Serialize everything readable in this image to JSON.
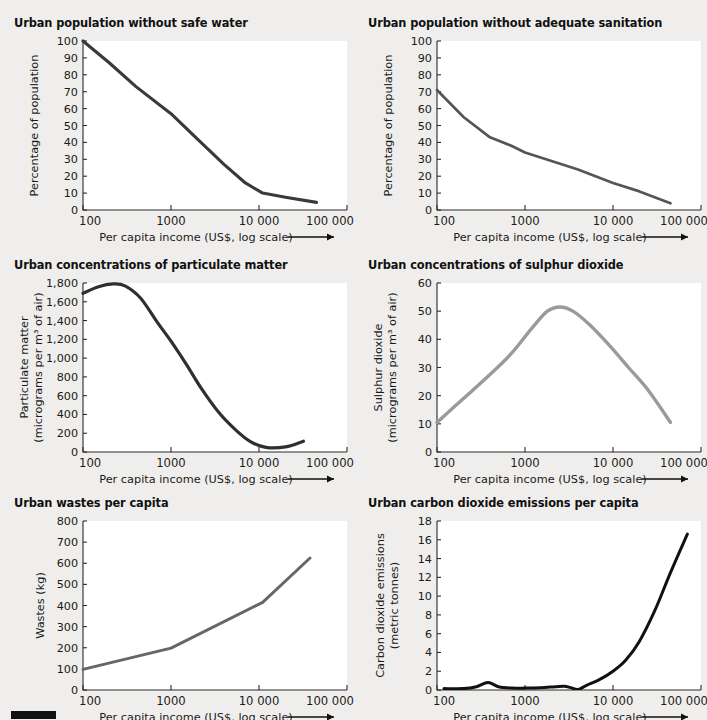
{
  "figure": {
    "background_color": "#efeeec",
    "plot_background_color": "#ffffff",
    "corner_marker": "black-bar"
  },
  "common": {
    "xlabel": "Per capita income (US$, log scale)",
    "xticks": [
      "100",
      "1000",
      "10 000",
      "100 000"
    ],
    "xlim": [
      100,
      100000
    ],
    "xscale": "log"
  },
  "chart_data": [
    {
      "id": "safe-water",
      "type": "line",
      "title": "Urban population without safe water",
      "xlabel": "Per capita income (US$, log scale)",
      "ylabel": "Percentage of population",
      "xscale": "log",
      "xlim": [
        100,
        100000
      ],
      "ylim": [
        0,
        100
      ],
      "xticks": [
        "100",
        "1000",
        "10 000",
        "100 000"
      ],
      "yticks": [
        "0",
        "10",
        "20",
        "30",
        "40",
        "50",
        "60",
        "70",
        "80",
        "90",
        "100"
      ],
      "grid": false,
      "legend": "none",
      "line_color": "#3a3a3a",
      "x": [
        100,
        200,
        400,
        1000,
        2000,
        4000,
        7000,
        11000,
        20000,
        45000
      ],
      "y": [
        100,
        87,
        73,
        57,
        42,
        27,
        16,
        10,
        7.5,
        4.5
      ]
    },
    {
      "id": "sanitation",
      "type": "line",
      "title": "Urban population without adequate sanitation",
      "xlabel": "Per capita income (US$, log scale)",
      "ylabel": "Percentage of population",
      "xscale": "log",
      "xlim": [
        100,
        100000
      ],
      "ylim": [
        0,
        100
      ],
      "xticks": [
        "100",
        "1000",
        "10 000",
        "100 000"
      ],
      "yticks": [
        "0",
        "10",
        "20",
        "30",
        "40",
        "50",
        "60",
        "70",
        "80",
        "90",
        "100"
      ],
      "grid": false,
      "legend": "none",
      "line_color": "#555555",
      "x": [
        100,
        200,
        400,
        700,
        1000,
        2000,
        4000,
        10000,
        20000,
        45000
      ],
      "y": [
        71,
        55,
        43,
        38,
        34,
        29,
        24,
        16,
        11,
        4
      ]
    },
    {
      "id": "particulate-matter",
      "type": "line",
      "title": "Urban concentrations of particulate matter",
      "xlabel": "Per capita income (US$, log scale)",
      "ylabel": "Particulate matter (micrograms per m3 of air)",
      "ylabel_line1": "Particulate matter",
      "ylabel_line2": "(micrograms per m³ of air)",
      "xscale": "log",
      "xlim": [
        100,
        100000
      ],
      "ylim": [
        0,
        1800
      ],
      "xticks": [
        "100",
        "1000",
        "10 000",
        "100 000"
      ],
      "yticks": [
        "0",
        "200",
        "400",
        "600",
        "800",
        "1,000",
        "1,200",
        "1,400",
        "1,600",
        "1,800"
      ],
      "grid": false,
      "legend": "none",
      "line_color": "#2f2f2f",
      "x": [
        100,
        150,
        220,
        300,
        450,
        700,
        1000,
        1500,
        2200,
        3500,
        5500,
        8000,
        12000,
        20000,
        32000
      ],
      "y": [
        1690,
        1760,
        1790,
        1770,
        1640,
        1380,
        1180,
        930,
        680,
        420,
        230,
        110,
        50,
        55,
        115
      ]
    },
    {
      "id": "sulphur-dioxide",
      "type": "line",
      "title": "Urban concentrations of sulphur dioxide",
      "xlabel": "Per capita income (US$, log scale)",
      "ylabel": "Sulphur dioxide (micrograms per m3 of air)",
      "ylabel_line1": "Sulphur dioxide",
      "ylabel_line2": "(micrograms per m³ of air)",
      "xscale": "log",
      "xlim": [
        100,
        100000
      ],
      "ylim": [
        0,
        60
      ],
      "xticks": [
        "100",
        "1000",
        "10 000",
        "100 000"
      ],
      "yticks": [
        "0",
        "10",
        "20",
        "30",
        "40",
        "50",
        "60"
      ],
      "grid": false,
      "legend": "none",
      "line_color": "#9a9a9a",
      "x": [
        100,
        200,
        400,
        700,
        1200,
        1800,
        2500,
        3500,
        5500,
        9000,
        15000,
        25000,
        45000
      ],
      "y": [
        10.5,
        19,
        27.5,
        35,
        44,
        50,
        51.5,
        50,
        45,
        38,
        30,
        22,
        10.5
      ]
    },
    {
      "id": "wastes-per-capita",
      "type": "line",
      "title": "Urban wastes per capita",
      "xlabel": "Per capita income (US$, log scale)",
      "ylabel": "Wastes (kg)",
      "xscale": "log",
      "xlim": [
        100,
        100000
      ],
      "ylim": [
        0,
        800
      ],
      "xticks": [
        "100",
        "1000",
        "10 000",
        "100 000"
      ],
      "yticks": [
        "0",
        "100",
        "200",
        "300",
        "400",
        "500",
        "600",
        "700",
        "800"
      ],
      "grid": false,
      "legend": "none",
      "line_color": "#666666",
      "x": [
        100,
        1000,
        11000,
        38000
      ],
      "y": [
        98,
        198,
        415,
        625
      ]
    },
    {
      "id": "carbon-dioxide-emissions",
      "type": "line",
      "title": "Urban carbon dioxide emissions per capita",
      "xlabel": "Per capita income (US$, log scale)",
      "ylabel": "Carbon dioxide emissions (metric tonnes)",
      "ylabel_line1": "Carbon dioxide emissions",
      "ylabel_line2": "(metric tonnes)",
      "xscale": "log",
      "xlim": [
        100,
        100000
      ],
      "ylim": [
        0,
        18
      ],
      "xticks": [
        "100",
        "1000",
        "10 000",
        "100 000"
      ],
      "yticks": [
        "0",
        "2",
        "4",
        "6",
        "8",
        "10",
        "12",
        "14",
        "16",
        "18"
      ],
      "grid": false,
      "legend": "none",
      "line_color": "#111111",
      "x": [
        120,
        200,
        280,
        380,
        500,
        700,
        1000,
        1500,
        2200,
        2800,
        3300,
        4000,
        5000,
        7000,
        10000,
        14000,
        20000,
        30000,
        45000,
        70000
      ],
      "y": [
        0.15,
        0.15,
        0.35,
        0.8,
        0.35,
        0.2,
        0.2,
        0.25,
        0.35,
        0.4,
        0.25,
        0.05,
        0.5,
        1.1,
        2.0,
        3.2,
        5.2,
        8.5,
        12.5,
        16.6
      ]
    }
  ]
}
